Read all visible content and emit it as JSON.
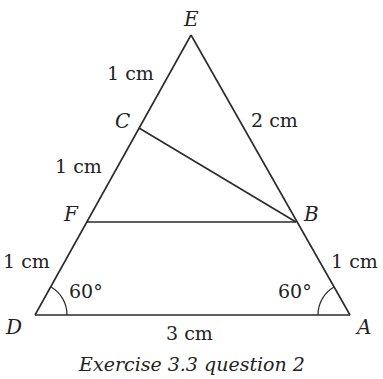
{
  "points": {
    "E": {
      "label": "E",
      "x": 191,
      "y": 35
    },
    "C": {
      "label": "C",
      "x": 139,
      "y": 128
    },
    "F": {
      "label": "F",
      "x": 87,
      "y": 222
    },
    "D": {
      "label": "D",
      "x": 35,
      "y": 315
    },
    "A": {
      "label": "A",
      "x": 350,
      "y": 315
    },
    "B": {
      "label": "B",
      "x": 296,
      "y": 222
    }
  },
  "lengths": {
    "EC": "1 cm",
    "CF": "1 cm",
    "FD": "1 cm",
    "EB": "2 cm",
    "BA": "1 cm",
    "DA": "3 cm"
  },
  "angles": {
    "D": "60°",
    "A": "60°"
  },
  "caption": "Exercise 3.3 question 2",
  "colors": {
    "line": "#2a2a2a",
    "text": "#222222",
    "background": "#ffffff"
  }
}
